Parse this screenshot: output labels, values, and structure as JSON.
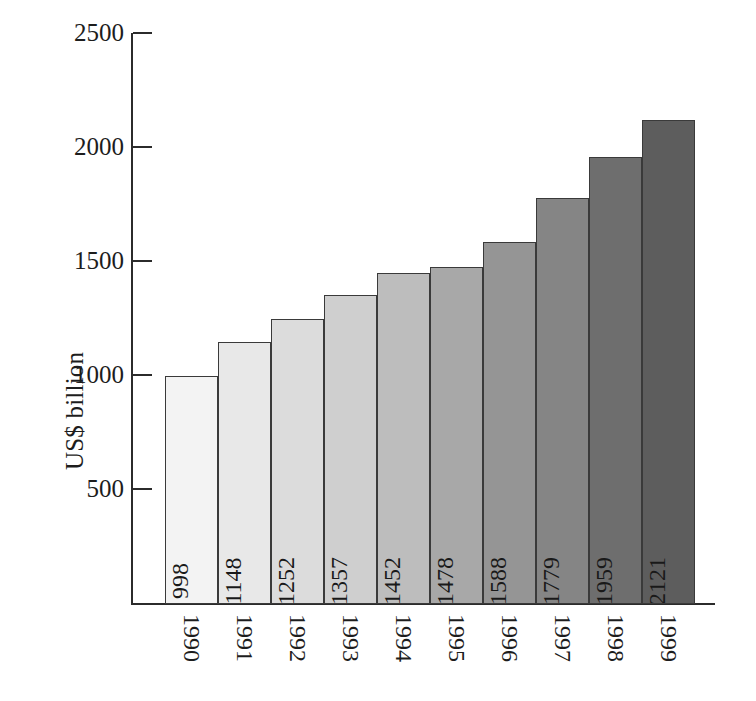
{
  "chart_data": {
    "type": "bar",
    "title": "",
    "xlabel": "",
    "ylabel": "US$ billion",
    "categories": [
      "1990",
      "1991",
      "1992",
      "1993",
      "1994",
      "1995",
      "1996",
      "1997",
      "1998",
      "1999"
    ],
    "values": [
      998,
      1148,
      1252,
      1357,
      1452,
      1478,
      1588,
      1779,
      1959,
      2121
    ],
    "value_labels": [
      "998",
      "1148",
      "1252",
      "1357",
      "1452",
      "1478",
      "1588",
      "1779",
      "1959",
      "2121"
    ],
    "ylim": [
      0,
      2500
    ],
    "ytick_values": [
      2500,
      2000,
      1500,
      1000,
      500
    ],
    "ytick_labels": [
      "2500",
      "2000",
      "1500",
      "1000",
      "500"
    ],
    "grid": false,
    "legend": null,
    "bar_colors": [
      "#f3f3f3",
      "#e8e8e8",
      "#dcdcdc",
      "#cfcfcf",
      "#bdbdbd",
      "#a8a8a8",
      "#959595",
      "#858585",
      "#6e6e6e",
      "#5d5d5d"
    ],
    "bar_outline_color": "#3a3a3a",
    "axis_color": "#2b2b2b",
    "background_color": "#ffffff",
    "bars_adjacent": true,
    "value_label_rotation": -90,
    "xtick_label_rotation": 90
  }
}
